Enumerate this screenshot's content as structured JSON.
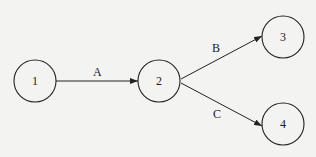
{
  "diagram": {
    "type": "directed-graph",
    "nodes": [
      {
        "id": "1",
        "label": "1",
        "cx": 35,
        "cy": 83
      },
      {
        "id": "2",
        "label": "2",
        "cx": 160,
        "cy": 83
      },
      {
        "id": "3",
        "label": "3",
        "cx": 283,
        "cy": 37
      },
      {
        "id": "4",
        "label": "4",
        "cx": 283,
        "cy": 127
      }
    ],
    "edges": [
      {
        "from": "1",
        "to": "2",
        "label": "A"
      },
      {
        "from": "2",
        "to": "3",
        "label": "B"
      },
      {
        "from": "2",
        "to": "4",
        "label": "C"
      }
    ]
  }
}
